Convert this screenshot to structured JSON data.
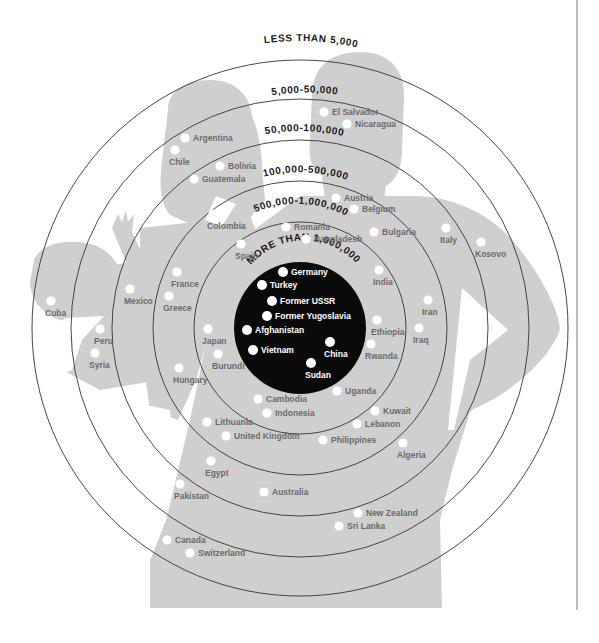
{
  "colors": {
    "background": "#ffffff",
    "silhouette": "#cfcfcf",
    "ring_stroke": "#333333",
    "core_fill": "#0a0a0a",
    "dot": "#ffffff",
    "label": "#6b6b6b",
    "core_label": "#ffffff",
    "ring_label": "#1a1a1a"
  },
  "center": {
    "x": 300,
    "y": 328
  },
  "rings": [
    {
      "id": "more-than-1000000",
      "label": "MORE THAN 1,000,000",
      "radius": 66,
      "filled": true
    },
    {
      "id": "500000-1000000",
      "label": "500,000-1,000,000",
      "radius": 106,
      "filled": false
    },
    {
      "id": "100000-500000",
      "label": "100,000-500,000",
      "radius": 147,
      "filled": false
    },
    {
      "id": "50000-100000",
      "label": "50,000-100,000",
      "radius": 188,
      "filled": false
    },
    {
      "id": "5000-50000",
      "label": "5,000-50,000",
      "radius": 229,
      "filled": false
    },
    {
      "id": "less-than-5000",
      "label": "LESS THAN 5,000",
      "radius": 268,
      "filled": false
    }
  ],
  "countries": [
    {
      "name": "Germany",
      "x": 283,
      "y": 272,
      "tier": "more-than-1000000"
    },
    {
      "name": "Turkey",
      "x": 262,
      "y": 285,
      "tier": "more-than-1000000"
    },
    {
      "name": "Former USSR",
      "x": 272,
      "y": 301,
      "tier": "more-than-1000000"
    },
    {
      "name": "Former Yugoslavia",
      "x": 267,
      "y": 316,
      "tier": "more-than-1000000"
    },
    {
      "name": "Afghanistan",
      "x": 247,
      "y": 330,
      "tier": "more-than-1000000"
    },
    {
      "name": "Vietnam",
      "x": 253,
      "y": 350,
      "tier": "more-than-1000000"
    },
    {
      "name": "China",
      "x": 330,
      "y": 342,
      "tier": "more-than-1000000"
    },
    {
      "name": "Sudan",
      "x": 311,
      "y": 363,
      "tier": "more-than-1000000"
    },
    {
      "name": "Romania",
      "x": 286,
      "y": 227,
      "tier": "500000-1000000"
    },
    {
      "name": "Bangladesh",
      "x": 306,
      "y": 239,
      "tier": "500000-1000000"
    },
    {
      "name": "Spain",
      "x": 241,
      "y": 244,
      "tier": "500000-1000000"
    },
    {
      "name": "India",
      "x": 379,
      "y": 270,
      "tier": "500000-1000000"
    },
    {
      "name": "Ethiopia",
      "x": 377,
      "y": 320,
      "tier": "500000-1000000"
    },
    {
      "name": "Rwanda",
      "x": 371,
      "y": 344,
      "tier": "500000-1000000"
    },
    {
      "name": "Japan",
      "x": 208,
      "y": 329,
      "tier": "500000-1000000"
    },
    {
      "name": "Burundi",
      "x": 218,
      "y": 354,
      "tier": "500000-1000000"
    },
    {
      "name": "Uganda",
      "x": 337,
      "y": 391,
      "tier": "500000-1000000"
    },
    {
      "name": "Cambodia",
      "x": 258,
      "y": 399,
      "tier": "500000-1000000"
    },
    {
      "name": "Indonesia",
      "x": 267,
      "y": 413,
      "tier": "500000-1000000"
    },
    {
      "name": "Austria",
      "x": 336,
      "y": 198,
      "tier": "100000-500000"
    },
    {
      "name": "Belgium",
      "x": 354,
      "y": 209,
      "tier": "100000-500000"
    },
    {
      "name": "Colombia",
      "x": 213,
      "y": 214,
      "tier": "100000-500000"
    },
    {
      "name": "Bulgaria",
      "x": 374,
      "y": 232,
      "tier": "100000-500000"
    },
    {
      "name": "France",
      "x": 177,
      "y": 272,
      "tier": "100000-500000"
    },
    {
      "name": "Greece",
      "x": 169,
      "y": 296,
      "tier": "100000-500000"
    },
    {
      "name": "Iran",
      "x": 428,
      "y": 300,
      "tier": "100000-500000"
    },
    {
      "name": "Iraq",
      "x": 419,
      "y": 328,
      "tier": "100000-500000"
    },
    {
      "name": "Hungary",
      "x": 179,
      "y": 368,
      "tier": "100000-500000"
    },
    {
      "name": "Kuwait",
      "x": 375,
      "y": 411,
      "tier": "100000-500000"
    },
    {
      "name": "Lebanon",
      "x": 357,
      "y": 424,
      "tier": "100000-500000"
    },
    {
      "name": "Lithuania",
      "x": 207,
      "y": 422,
      "tier": "100000-500000"
    },
    {
      "name": "United Kingdom",
      "x": 226,
      "y": 436,
      "tier": "100000-500000"
    },
    {
      "name": "Philippines",
      "x": 323,
      "y": 440,
      "tier": "100000-500000"
    },
    {
      "name": "Argentina",
      "x": 185,
      "y": 138,
      "tier": "50000-100000"
    },
    {
      "name": "Chile",
      "x": 175,
      "y": 150,
      "tier": "50000-100000"
    },
    {
      "name": "Bolivia",
      "x": 220,
      "y": 166,
      "tier": "50000-100000"
    },
    {
      "name": "Guatemala",
      "x": 194,
      "y": 179,
      "tier": "50000-100000"
    },
    {
      "name": "Mexico",
      "x": 130,
      "y": 289,
      "tier": "50000-100000"
    },
    {
      "name": "Italy",
      "x": 446,
      "y": 228,
      "tier": "50000-100000"
    },
    {
      "name": "Algeria",
      "x": 403,
      "y": 443,
      "tier": "50000-100000"
    },
    {
      "name": "Egypt",
      "x": 211,
      "y": 461,
      "tier": "50000-100000"
    },
    {
      "name": "Australia",
      "x": 264,
      "y": 492,
      "tier": "50000-100000"
    },
    {
      "name": "El Salvador",
      "x": 324,
      "y": 112,
      "tier": "5000-50000"
    },
    {
      "name": "Nicaragua",
      "x": 347,
      "y": 124,
      "tier": "5000-50000"
    },
    {
      "name": "Kosovo",
      "x": 481,
      "y": 242,
      "tier": "5000-50000"
    },
    {
      "name": "Peru",
      "x": 100,
      "y": 329,
      "tier": "5000-50000"
    },
    {
      "name": "Syria",
      "x": 95,
      "y": 353,
      "tier": "5000-50000"
    },
    {
      "name": "Pakistan",
      "x": 180,
      "y": 484,
      "tier": "5000-50000"
    },
    {
      "name": "New Zealand",
      "x": 358,
      "y": 513,
      "tier": "5000-50000"
    },
    {
      "name": "Sri Lanka",
      "x": 339,
      "y": 526,
      "tier": "5000-50000"
    },
    {
      "name": "Cuba",
      "x": 51,
      "y": 301,
      "tier": "less-than-5000"
    },
    {
      "name": "Canada",
      "x": 167,
      "y": 540,
      "tier": "less-than-5000"
    },
    {
      "name": "Switzerland",
      "x": 190,
      "y": 553,
      "tier": "less-than-5000"
    }
  ],
  "label_positions": {
    "Germany": "right",
    "Turkey": "right",
    "Former USSR": "right",
    "Former Yugoslavia": "right",
    "Afghanistan": "right",
    "Vietnam": "right",
    "China": "below",
    "Sudan": "below",
    "Romania": "right",
    "Bangladesh": "right",
    "Spain": "below",
    "India": "below",
    "Ethiopia": "below",
    "Rwanda": "below",
    "Japan": "below",
    "Burundi": "below",
    "Uganda": "right",
    "Cambodia": "right",
    "Indonesia": "right",
    "Austria": "right",
    "Belgium": "right",
    "Colombia": "below",
    "Bulgaria": "right",
    "France": "below",
    "Greece": "below",
    "Iran": "below",
    "Iraq": "below",
    "Hungary": "below",
    "Kuwait": "right",
    "Lebanon": "right",
    "Lithuania": "right",
    "United Kingdom": "right",
    "Philippines": "right",
    "Argentina": "right",
    "Chile": "below",
    "Bolivia": "right",
    "Guatemala": "right",
    "Mexico": "below",
    "Italy": "below",
    "Algeria": "below",
    "Egypt": "below",
    "Australia": "right",
    "El Salvador": "right",
    "Nicaragua": "right",
    "Kosovo": "below",
    "Peru": "below",
    "Syria": "below",
    "Pakistan": "below",
    "New Zealand": "right",
    "Sri Lanka": "right",
    "Cuba": "below",
    "Canada": "right",
    "Switzerland": "right"
  },
  "frame": {
    "divider_x": 577,
    "divider_top": 0,
    "divider_bottom": 610
  }
}
